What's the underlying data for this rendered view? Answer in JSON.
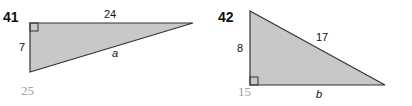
{
  "problems": [
    {
      "number": "41",
      "sides": {
        "top": "24",
        "left": "7",
        "hypotenuse": "a"
      },
      "answer": "25"
    },
    {
      "number": "42",
      "sides": {
        "left": "8",
        "hypotenuse": "17",
        "bottom": "b"
      },
      "answer": "15"
    }
  ],
  "colors": {
    "fill": "#c8c8c8",
    "stroke": "#333333",
    "answer": "#a0a0a0"
  }
}
